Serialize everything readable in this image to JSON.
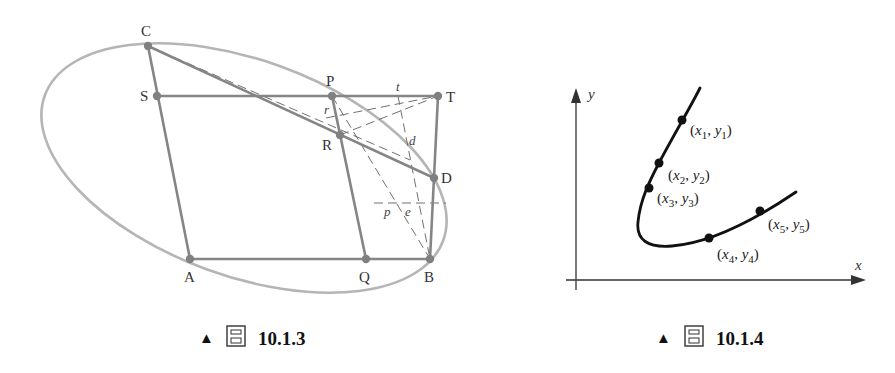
{
  "figures": [
    {
      "id": "fig-10-1-3",
      "caption": {
        "marker": "▲",
        "label_char": "圖",
        "number": "10.1.3"
      },
      "points": {
        "C": "C",
        "S": "S",
        "P": "P",
        "T": "T",
        "R": "R",
        "D": "D",
        "A": "A",
        "Q": "Q",
        "B": "B"
      },
      "minor_labels": {
        "t": "t",
        "r": "r",
        "d": "d",
        "p": "p",
        "e": "e"
      },
      "colors": {
        "ellipse": "#b3b3b3",
        "solid_lines": "#858585",
        "dashed_lines": "#6e6e6e",
        "points": "#808080"
      }
    },
    {
      "id": "fig-10-1-4",
      "caption": {
        "marker": "▲",
        "label_char": "圖",
        "number": "10.1.4"
      },
      "axes": {
        "x_label": "x",
        "y_label": "y"
      },
      "data_points": [
        {
          "x": "x",
          "xs": "1",
          "y": "y",
          "ys": "1"
        },
        {
          "x": "x",
          "xs": "2",
          "y": "y",
          "ys": "2"
        },
        {
          "x": "x",
          "xs": "3",
          "y": "y",
          "ys": "3"
        },
        {
          "x": "x",
          "xs": "4",
          "y": "y",
          "ys": "4"
        },
        {
          "x": "x",
          "xs": "5",
          "y": "y",
          "ys": "5"
        }
      ],
      "colors": {
        "curve": "#111111",
        "axes": "#333333"
      }
    }
  ]
}
